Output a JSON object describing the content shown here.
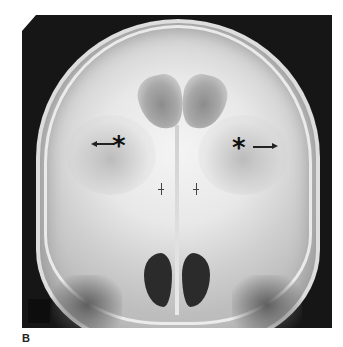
{
  "figure": {
    "panel_label": "B",
    "image": {
      "type": "radiograph",
      "view": "frontal skull x-ray",
      "annotations": [
        {
          "symbol": "*",
          "arrow_direction": "left",
          "side": "left"
        },
        {
          "symbol": "*",
          "arrow_direction": "right",
          "side": "right"
        }
      ],
      "tick_marks": 2
    }
  }
}
